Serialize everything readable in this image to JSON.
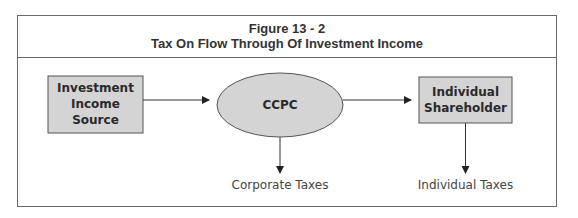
{
  "figure": {
    "number": "Figure 13 - 2",
    "title": "Tax On Flow Through Of Investment Income"
  },
  "nodes": [
    {
      "id": "source",
      "shape": "rectangle",
      "lines": [
        "Investment",
        "Income",
        "Source"
      ]
    },
    {
      "id": "ccpc",
      "shape": "ellipse",
      "lines": [
        "CCPC"
      ]
    },
    {
      "id": "shareholder",
      "shape": "rectangle",
      "lines": [
        "Individual",
        "Shareholder"
      ]
    }
  ],
  "outputs": [
    {
      "from": "ccpc",
      "label": "Corporate Taxes"
    },
    {
      "from": "shareholder",
      "label": "Individual Taxes"
    }
  ],
  "edges": [
    {
      "from": "source",
      "to": "ccpc"
    },
    {
      "from": "ccpc",
      "to": "shareholder"
    },
    {
      "from": "ccpc",
      "to": "Corporate Taxes"
    },
    {
      "from": "shareholder",
      "to": "Individual Taxes"
    }
  ],
  "colors": {
    "node_fill": "#d4d4d4",
    "stroke": "#555555",
    "frame": "#6a6a6a"
  }
}
